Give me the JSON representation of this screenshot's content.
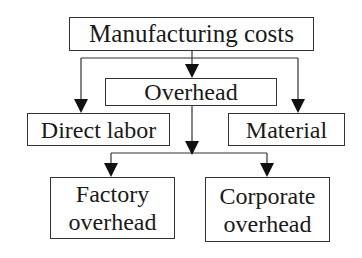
{
  "diagram": {
    "root": {
      "label": "Manufacturing costs"
    },
    "overhead": {
      "label": "Overhead"
    },
    "direct_labor": {
      "label": "Direct labor"
    },
    "material": {
      "label": "Material"
    },
    "factory_overhead": {
      "line1": "Factory",
      "line2": "overhead"
    },
    "corporate_overhead": {
      "line1": "Corporate",
      "line2": "overhead"
    }
  }
}
